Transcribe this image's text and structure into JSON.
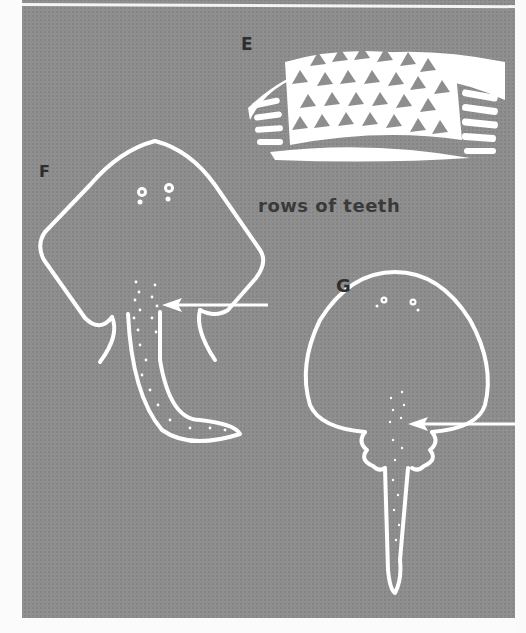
{
  "figure": {
    "labels": {
      "e": "E",
      "f": "F",
      "g": "G"
    },
    "caption": "rows of teeth",
    "panels": [
      {
        "label": "E",
        "subject": "tooth plate with rows of teeth"
      },
      {
        "label": "F",
        "subject": "ray with curved tail, arrow pointing to rows of teeth"
      },
      {
        "label": "G",
        "subject": "round-bodied ray with straight tail, arrow pointing to rows of teeth"
      }
    ],
    "colors": {
      "background": "#8e8e8e",
      "line_art": "#ffffff",
      "text": "#2e2e2e",
      "page": "#fbfbfb"
    }
  }
}
